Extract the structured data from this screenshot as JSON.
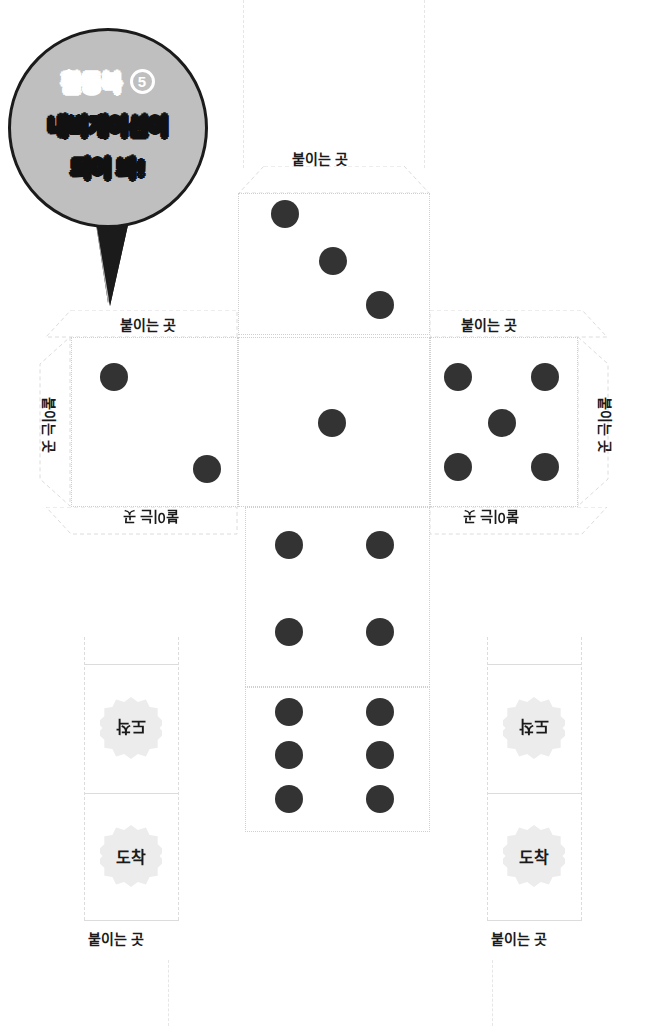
{
  "page": {
    "background": "#ffffff",
    "width": 646,
    "height": 1026
  },
  "speech_bubble": {
    "workbook_label": "활동북",
    "workbook_number": "5",
    "line2": "내비게이션이",
    "line3": "되어 봐!",
    "fill_color": "#bfbfbf",
    "outline_color": "#1b1b1b",
    "line1_text_color": "#ffffff",
    "line2_text_color": "#111111"
  },
  "labels": {
    "glue": "붙이는 곳",
    "arrival": "도착"
  },
  "colors": {
    "pip": "#333333",
    "cut_line": "#cfcfcf",
    "fold_line": "#dcdcdc",
    "badge_fill": "#ececec",
    "paper": "#ffffff"
  },
  "dieline": {
    "faces": [
      {
        "name": "face-top",
        "pips": 3,
        "position": "top-center"
      },
      {
        "name": "face-left",
        "pips": 2,
        "position": "middle-left"
      },
      {
        "name": "face-center",
        "pips": 1,
        "position": "middle-center"
      },
      {
        "name": "face-right",
        "pips": 5,
        "position": "middle-right"
      },
      {
        "name": "face-four",
        "pips": 4,
        "position": "lower-center"
      },
      {
        "name": "face-six",
        "pips": 6,
        "position": "bottom-center"
      }
    ],
    "flaps": [
      {
        "name": "flap-top",
        "label": "붙이는 곳",
        "rotation": 0
      },
      {
        "name": "flap-left-top",
        "label": "붙이는 곳",
        "rotation": 0
      },
      {
        "name": "flap-left-side",
        "label": "붙이는 곳",
        "rotation": 90
      },
      {
        "name": "flap-left-bottom",
        "label": "붙이는 곳",
        "rotation": 180
      },
      {
        "name": "flap-right-top",
        "label": "붙이는 곳",
        "rotation": 0
      },
      {
        "name": "flap-right-side",
        "label": "붙이는 곳",
        "rotation": 90
      },
      {
        "name": "flap-right-bottom",
        "label": "붙이는 곳",
        "rotation": 180
      }
    ]
  },
  "left_column": {
    "badge_top": "도착",
    "badge_top_rotation": 180,
    "badge_bottom": "도착",
    "badge_bottom_rotation": 0,
    "footer_label": "붙이는 곳"
  },
  "right_column": {
    "badge_top": "도착",
    "badge_top_rotation": 180,
    "badge_bottom": "도착",
    "badge_bottom_rotation": 0,
    "footer_label": "붙이는 곳"
  }
}
